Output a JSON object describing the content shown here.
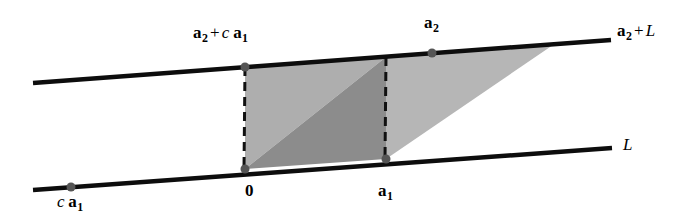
{
  "figure": {
    "background_color": "#ffffff",
    "width": 694,
    "height": 220
  },
  "colors": {
    "line": "#0d0d0d",
    "dashed": "#111111",
    "point": "#555555",
    "fill_light": "#aeaeae",
    "fill_dark": "#8c8c8c",
    "fill_right": "#b6b6b6",
    "text": "#000000"
  },
  "labels": {
    "top_left_point": {
      "bold1": "a",
      "sub1": "2",
      "op": "+",
      "italic": "c",
      "bold2": "a",
      "sub2": "1"
    },
    "top_mid_point": {
      "bold1": "a",
      "sub1": "2"
    },
    "top_line_name": {
      "bold1": "a",
      "sub1": "2",
      "op": "+",
      "italic": "L"
    },
    "bottom_line_name": {
      "italic": "L"
    },
    "origin": {
      "bold1": "0"
    },
    "bottom_right_point": {
      "bold1": "a",
      "sub1": "1"
    },
    "bottom_left_point": {
      "italic": "c",
      "bold2": "a",
      "sub2": "1"
    }
  },
  "geometry": {
    "top_line": {
      "x1": 33,
      "y1": 83,
      "x2": 611,
      "y2": 40,
      "stroke_width": 4.5
    },
    "bottom_line": {
      "x1": 33,
      "y1": 190,
      "x2": 612,
      "y2": 148,
      "stroke_width": 4.5
    },
    "dashed_left": {
      "x1": 245,
      "y1": 67,
      "x2": 244,
      "y2": 169,
      "stroke_width": 3
    },
    "dashed_right": {
      "x1": 386,
      "y1": 57,
      "x2": 385,
      "y2": 159,
      "stroke_width": 3
    },
    "points": [
      {
        "name": "a2-plus-c-a1",
        "cx": 245,
        "cy": 67,
        "r": 4.5
      },
      {
        "name": "a2",
        "cx": 432,
        "cy": 53,
        "r": 4.5
      },
      {
        "name": "origin",
        "cx": 245,
        "cy": 169,
        "r": 4.5
      },
      {
        "name": "a1",
        "cx": 386,
        "cy": 159,
        "r": 4.5
      },
      {
        "name": "c-a1",
        "cx": 71,
        "cy": 187,
        "r": 4.5
      }
    ],
    "parallelogram_light_triangle": "245,67 386,57 245,169",
    "parallelogram_dark_triangle": "386,57 386,159 245,169",
    "right_triangle": "386,57 553,45 386,159"
  }
}
